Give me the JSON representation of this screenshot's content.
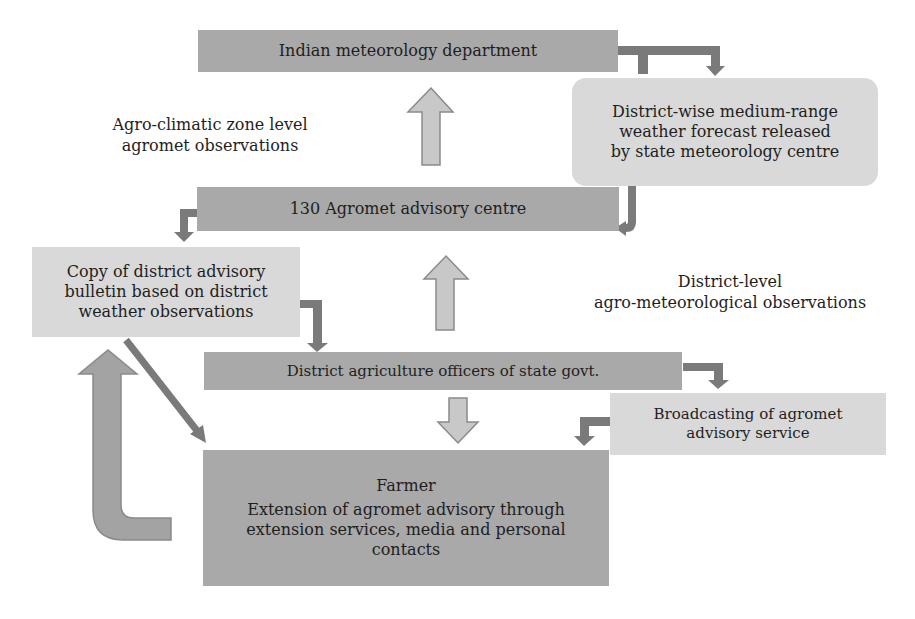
{
  "diagram": {
    "nodes": {
      "imd": "Indian meteorology department",
      "state_centre": [
        "District-wise medium-range",
        "weather forecast released",
        "by state meteorology centre"
      ],
      "aac": "130 Agromet advisory centre",
      "bulletin": [
        "Copy of district advisory",
        "bulletin based on district",
        "weather observations"
      ],
      "dao": "District agriculture officers of state govt.",
      "broadcast": [
        "Broadcasting of agromet",
        "advisory service"
      ],
      "farmer_title": "Farmer",
      "farmer_body": [
        "Extension of agromet advisory through",
        "extension services, media and personal",
        "contacts"
      ]
    },
    "labels": {
      "agro_climatic": [
        "Agro-climatic zone level",
        "agromet observations"
      ],
      "district_level": [
        "District-level",
        "agro-meteorological observations"
      ]
    },
    "colors": {
      "dark_box": "#a9a9a9",
      "light_box": "#d9d9d9",
      "connector": "#7a7a7a",
      "hollow_arrow_fill": "#c8c8c8",
      "hollow_arrow_stroke": "#8a8a8a"
    }
  }
}
